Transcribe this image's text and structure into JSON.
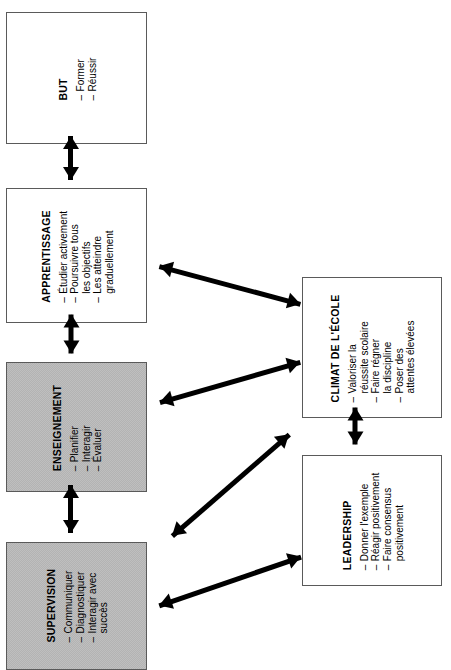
{
  "diagram": {
    "orientation": "rotated-90-counterclockwise",
    "shaded_color": "#bfbfbf",
    "line_color": "#5a5a5a",
    "arrow_color": "#000000",
    "boxes": [
      {
        "id": "but",
        "title": "BUT",
        "shaded": false,
        "items": [
          "Former",
          "Réussir"
        ]
      },
      {
        "id": "apprentissage",
        "title": "APPRENTISSAGE",
        "shaded": false,
        "items": [
          "Étudier activement",
          "Poursuivre tous\nles objectifs",
          "Les atteindre\ngraduellement"
        ]
      },
      {
        "id": "enseignement",
        "title": "ENSEIGNEMENT",
        "shaded": true,
        "items": [
          "Planifier",
          "Interagir",
          "Évaluer"
        ]
      },
      {
        "id": "supervision",
        "title": "SUPERVISION",
        "shaded": true,
        "items": [
          "Communiquer",
          "Diagnostiquer",
          "Interagir avec\nsuccès"
        ]
      },
      {
        "id": "climat",
        "title": "CLIMAT DE L'ÉCOLE",
        "shaded": false,
        "items": [
          "Valoriser la\nréussite scolaire",
          "Faire régner\nla discipline",
          "Poser des\nattentes élevées"
        ]
      },
      {
        "id": "leadership",
        "title": "LEADERSHIP",
        "shaded": false,
        "items": [
          "Donner l'exemple",
          "Réagir positivement",
          "Faire consensus\npositivement"
        ]
      }
    ],
    "connections": [
      {
        "id": "but-apprentissage",
        "from": "but",
        "to": "apprentissage",
        "style": "double-headed"
      },
      {
        "id": "apprentissage-enseignement",
        "from": "apprentissage",
        "to": "enseignement",
        "style": "double-headed"
      },
      {
        "id": "enseignement-supervision",
        "from": "enseignement",
        "to": "supervision",
        "style": "double-headed"
      },
      {
        "id": "apprentissage-climat",
        "from": "apprentissage",
        "to": "climat",
        "style": "double-headed"
      },
      {
        "id": "enseignement-climat",
        "from": "enseignement",
        "to": "climat",
        "style": "double-headed"
      },
      {
        "id": "supervision-climat",
        "from": "supervision",
        "to": "climat",
        "style": "double-headed"
      },
      {
        "id": "supervision-leadership",
        "from": "supervision",
        "to": "leadership",
        "style": "double-headed"
      },
      {
        "id": "climat-leadership",
        "from": "climat",
        "to": "leadership",
        "style": "double-headed"
      }
    ]
  }
}
